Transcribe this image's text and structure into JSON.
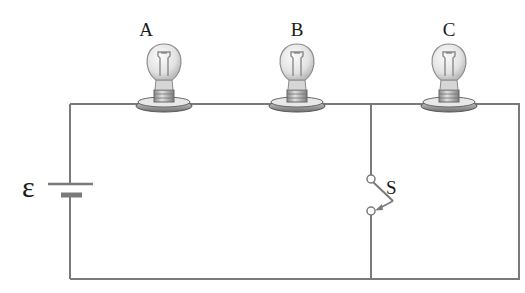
{
  "diagram": {
    "type": "circuit",
    "colors": {
      "wire": "#7a7a7a",
      "bulb_glass": "#e6e6e6",
      "bulb_outline": "#8c8c8c",
      "base": "#a8a8a8",
      "label": "#1a1a1a"
    },
    "battery": {
      "label": "ε"
    },
    "bulbs": [
      {
        "id": "A",
        "label": "A",
        "cx": 164
      },
      {
        "id": "B",
        "label": "B",
        "cx": 297
      },
      {
        "id": "C",
        "label": "C",
        "cx": 449
      }
    ],
    "switch": {
      "label": "S",
      "state": "open"
    }
  }
}
